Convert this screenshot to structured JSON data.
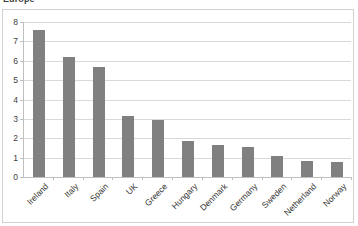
{
  "chart_data": {
    "type": "bar",
    "title": "Europe",
    "xlabel": "",
    "ylabel": "",
    "ylim": [
      0,
      8
    ],
    "ytick_labels": [
      "0",
      "1",
      "2",
      "3",
      "4",
      "5",
      "6",
      "7",
      "8"
    ],
    "yticks": [
      0,
      1,
      2,
      3,
      4,
      5,
      6,
      7,
      8
    ],
    "grid": true,
    "legend": false,
    "bar_color": "#808080",
    "gridline_color": "#d9d9d9",
    "categories": [
      "Ireland",
      "Italy",
      "Spain",
      "UK",
      "Greece",
      "Hungary",
      "Denmark",
      "Germany",
      "Sweden",
      "Netherland",
      "Norway"
    ],
    "values": [
      7.6,
      6.2,
      5.7,
      3.15,
      2.95,
      1.85,
      1.65,
      1.55,
      1.1,
      0.85,
      0.75
    ]
  }
}
